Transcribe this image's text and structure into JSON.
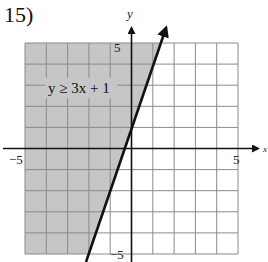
{
  "problem": {
    "number_label": "15)"
  },
  "chart_data": {
    "type": "line",
    "title": "",
    "annotation": "y ≥ 3x + 1",
    "inequality": {
      "expression": "y >= 3x + 1",
      "slope": 3,
      "intercept": 1,
      "boundary": "solid",
      "shaded_side": "above-left"
    },
    "boundary_line_points": [
      {
        "x": -2,
        "y": -5
      },
      {
        "x": 0,
        "y": 1
      },
      {
        "x": 1.333,
        "y": 5
      }
    ],
    "xlabel": "x",
    "ylabel": "y",
    "xlim": [
      -5,
      5
    ],
    "ylim": [
      -5,
      5
    ],
    "grid": true,
    "grid_step": 1,
    "tick_labels": {
      "x_min": "−5",
      "x_max": "5",
      "y_max": "5",
      "y_min": "−5"
    },
    "colors": {
      "shade": "#c6c6c6",
      "grid": "#8a8a8a",
      "axis": "#111111",
      "line": "#111111"
    }
  }
}
